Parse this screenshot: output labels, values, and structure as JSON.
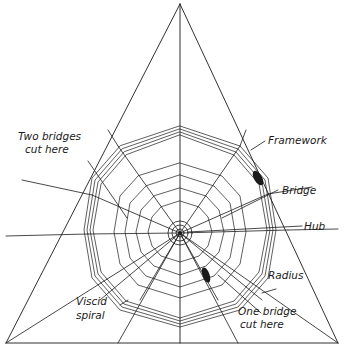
{
  "diagram": {
    "labels": {
      "two_bridges": [
        "Two bridges",
        "cut here"
      ],
      "framework": "Framework",
      "bridge": "Bridge",
      "hub": "Hub",
      "radius": "Radius",
      "viscid_spiral": [
        "Viscid",
        "spiral"
      ],
      "one_bridge": [
        "One bridge",
        "cut here"
      ]
    },
    "colors": {
      "ink": "#1a1a1a",
      "background": "#ffffff"
    }
  }
}
